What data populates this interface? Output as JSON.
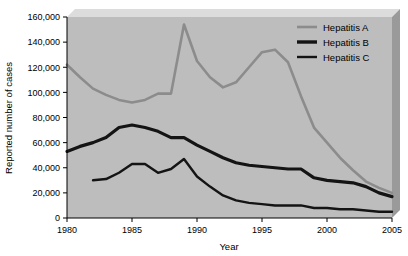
{
  "chart_data": {
    "type": "line",
    "title": "",
    "xlabel": "Year",
    "ylabel": "Reported number of cases",
    "xlim": [
      1980,
      2005
    ],
    "ylim": [
      0,
      160000
    ],
    "grid": false,
    "legend_position": "top-right",
    "xticks": [
      "1980",
      "1985",
      "1990",
      "1995",
      "2000",
      "2005"
    ],
    "xtick_values": [
      1980,
      1985,
      1990,
      1995,
      2000,
      2005
    ],
    "yticks": [
      "0",
      "20,000",
      "40,000",
      "60,000",
      "80,000",
      "100,000",
      "120,000",
      "140,000",
      "160,000"
    ],
    "ytick_values": [
      0,
      20000,
      40000,
      60000,
      80000,
      100000,
      120000,
      140000,
      160000
    ],
    "x": [
      1980,
      1981,
      1982,
      1983,
      1984,
      1985,
      1986,
      1987,
      1988,
      1989,
      1990,
      1991,
      1992,
      1993,
      1994,
      1995,
      1996,
      1997,
      1998,
      1999,
      2000,
      2001,
      2002,
      2003,
      2004,
      2005
    ],
    "series": [
      {
        "name": "Hepatitis A",
        "color": "#8c8c8c",
        "width": 2.6,
        "values": [
          122000,
          112000,
          103000,
          98000,
          94000,
          92000,
          94000,
          99000,
          99000,
          154000,
          125000,
          112000,
          104000,
          108000,
          120000,
          132000,
          134000,
          124000,
          97000,
          72000,
          60000,
          48000,
          38000,
          29000,
          24000,
          20000
        ]
      },
      {
        "name": "Hepatitis B",
        "color": "#141414",
        "width": 3.2,
        "values": [
          53000,
          57000,
          60000,
          64000,
          72000,
          74000,
          72000,
          69000,
          64000,
          64000,
          58000,
          53000,
          48000,
          44000,
          42000,
          41000,
          40000,
          39000,
          39000,
          32000,
          30000,
          29000,
          28000,
          25000,
          20000,
          17000
        ]
      },
      {
        "name": "Hepatitis C",
        "color": "#141414",
        "width": 2.4,
        "values": [
          null,
          null,
          30000,
          31000,
          36000,
          43000,
          43000,
          36000,
          39000,
          47000,
          33000,
          25000,
          18000,
          14000,
          12000,
          11000,
          10000,
          10000,
          10000,
          8000,
          8000,
          7000,
          7000,
          6000,
          5000,
          5000
        ]
      }
    ],
    "legend": [
      {
        "label": "Hepatitis A",
        "color": "#8c8c8c",
        "width": 2.6
      },
      {
        "label": "Hepatitis B",
        "color": "#141414",
        "width": 3.4
      },
      {
        "label": "Hepatitis C",
        "color": "#141414",
        "width": 2.4
      }
    ],
    "colors": {
      "plot_background": "#bdbdbd",
      "shadow_top": "#dcdcdc",
      "shadow_side": "#9a9a9a",
      "axis": "#000000",
      "page_background": "#ffffff"
    }
  }
}
